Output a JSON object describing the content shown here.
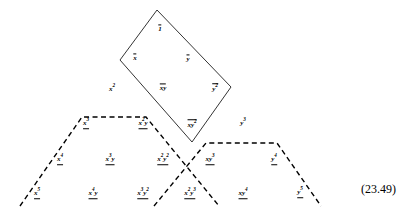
{
  "figure": {
    "equation_number": "(23.49)",
    "stroke_color": "#000000",
    "background_color": "#ffffff",
    "rhombus": {
      "style": "solid",
      "vertices": [
        [
          157,
          10
        ],
        [
          231,
          87
        ],
        [
          192,
          142
        ],
        [
          120,
          60
        ]
      ]
    },
    "left_trapezoid": {
      "style": "dashed",
      "vertices": [
        [
          20,
          205
        ],
        [
          82,
          117
        ],
        [
          146,
          117
        ],
        [
          218,
          205
        ]
      ]
    },
    "right_trapezoid": {
      "style": "dashed",
      "vertices": [
        [
          155,
          205
        ],
        [
          206,
          143
        ],
        [
          277,
          143
        ],
        [
          320,
          205
        ]
      ]
    },
    "terms": [
      {
        "id": "t-1-bar",
        "latex": "1",
        "base": "1",
        "sup": "",
        "decoration": "overline",
        "x": 160,
        "y": 29
      },
      {
        "id": "t-x-bar",
        "latex": "x",
        "base": "x",
        "sup": "",
        "decoration": "overline",
        "x": 135,
        "y": 58
      },
      {
        "id": "t-y-bar",
        "latex": "y",
        "base": "y",
        "sup": "",
        "decoration": "overline",
        "x": 188,
        "y": 59
      },
      {
        "id": "t-x2",
        "latex": "x^2",
        "base": "x",
        "sup": "2",
        "decoration": "none",
        "x": 112,
        "y": 89
      },
      {
        "id": "t-xy-bar",
        "latex": "xy",
        "base": "xy",
        "sup": "",
        "decoration": "overline",
        "x": 163,
        "y": 88
      },
      {
        "id": "t-y2-bar",
        "latex": "y^2",
        "base": "y",
        "sup": "2",
        "decoration": "overline",
        "x": 215,
        "y": 88
      },
      {
        "id": "t-x3",
        "latex": "x^3",
        "base": "x",
        "sup": "3",
        "decoration": "underline",
        "x": 86,
        "y": 124
      },
      {
        "id": "t-x2y",
        "latex": "x^2y",
        "base": "x",
        "sup": "2",
        "sup_tail": "y",
        "decoration": "underline",
        "x": 143,
        "y": 124
      },
      {
        "id": "t-xy2-bar",
        "latex": "xy^2",
        "base": "xy",
        "sup": "2",
        "decoration": "overline",
        "x": 192,
        "y": 124
      },
      {
        "id": "t-y3",
        "latex": "y^3",
        "base": "y",
        "sup": "3",
        "decoration": "none",
        "x": 243,
        "y": 123
      },
      {
        "id": "t-x4",
        "latex": "x^4",
        "base": "x",
        "sup": "4",
        "decoration": "underline",
        "x": 60,
        "y": 160
      },
      {
        "id": "t-x3y",
        "latex": "x^3y",
        "base": "x",
        "sup": "3",
        "sup_tail": "y",
        "decoration": "underline",
        "x": 110,
        "y": 160
      },
      {
        "id": "t-x2y2",
        "latex": "x^2y^2",
        "base": "x",
        "sup": "2",
        "sup_tail": "y",
        "sup2": "2",
        "decoration": "underline",
        "x": 163,
        "y": 160
      },
      {
        "id": "t-xy3",
        "latex": "xy^3",
        "base": "xy",
        "sup": "3",
        "decoration": "underline",
        "x": 210,
        "y": 160
      },
      {
        "id": "t-y4",
        "latex": "y^4",
        "base": "y",
        "sup": "4",
        "decoration": "underline",
        "x": 274,
        "y": 160
      },
      {
        "id": "t-x5",
        "latex": "x^5",
        "base": "x",
        "sup": "5",
        "decoration": "underline",
        "x": 37,
        "y": 194
      },
      {
        "id": "t-x4y",
        "latex": "x^4y",
        "base": "x",
        "sup": "4",
        "sup_tail": "y",
        "decoration": "underline",
        "x": 93,
        "y": 194
      },
      {
        "id": "t-x3y2",
        "latex": "x^3y^2",
        "base": "x",
        "sup": "3",
        "sup_tail": "y",
        "sup2": "2",
        "decoration": "underline",
        "x": 143,
        "y": 194
      },
      {
        "id": "t-x2y3",
        "latex": "x^2y^3",
        "base": "x",
        "sup": "2",
        "sup_tail": "y",
        "sup2": "3",
        "decoration": "underline",
        "x": 190,
        "y": 194
      },
      {
        "id": "t-xy4",
        "latex": "xy^4",
        "base": "xy",
        "sup": "4",
        "decoration": "underline",
        "x": 243,
        "y": 194
      },
      {
        "id": "t-y5",
        "latex": "y^5",
        "base": "y",
        "sup": "5",
        "decoration": "underline",
        "x": 300,
        "y": 193
      }
    ]
  }
}
